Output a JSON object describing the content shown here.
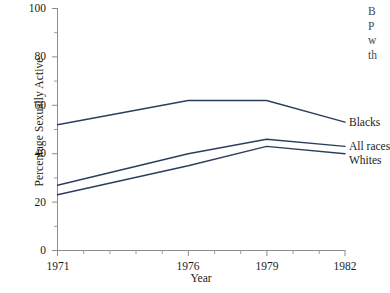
{
  "chart_data": {
    "type": "line",
    "title": "",
    "xlabel": "Year",
    "ylabel": "Percentage Sexually Active",
    "x": [
      1971,
      1976,
      1979,
      1982
    ],
    "xlim": [
      1971,
      1982
    ],
    "ylim": [
      0,
      100
    ],
    "xticks": [
      1971,
      1976,
      1979,
      1982
    ],
    "xtick_labels": [
      "1971",
      "1976",
      "1979",
      "1982"
    ],
    "yticks": [
      0,
      20,
      40,
      60,
      80,
      100
    ],
    "ytick_labels": [
      "0",
      "20",
      "40",
      "60",
      "80",
      "100"
    ],
    "y_minor_tick_step": 10,
    "x_minor_tick_step": 1,
    "grid": false,
    "legend_position": "right-of-line-ends",
    "line_color": "#2b3f5c",
    "axis_color": "#8c8c8c",
    "series": [
      {
        "name": "Blacks",
        "values": [
          52,
          62,
          62,
          53
        ]
      },
      {
        "name": "All races",
        "values": [
          27,
          40,
          46,
          43
        ]
      },
      {
        "name": "Whites",
        "values": [
          23,
          35,
          43,
          40
        ]
      }
    ]
  },
  "axes": {
    "y_title": "Percentage Sexually Active",
    "x_title": "Year",
    "y_tick_labels": [
      "100",
      "80",
      "60",
      "40",
      "20",
      "0"
    ],
    "x_tick_labels": [
      "1971",
      "1976",
      "1979",
      "1982"
    ]
  },
  "series_labels": {
    "blacks": "Blacks",
    "all_races": "All races",
    "whites": "Whites"
  },
  "body_text": {
    "line1": "B",
    "line2": "P",
    "line3": "w",
    "line4": "th"
  }
}
